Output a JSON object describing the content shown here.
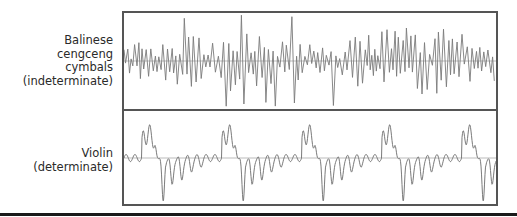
{
  "panels": [
    {
      "id": "cymbals",
      "label_lines": [
        "Balinese",
        "cengceng",
        "cymbals",
        "(indeterminate)"
      ],
      "waveform_type": "indeterminate",
      "description": "irregular noisy waveform with random amplitude spikes"
    },
    {
      "id": "violin",
      "label_lines": [
        "Violin",
        "(determinate)"
      ],
      "waveform_type": "determinate",
      "description": "periodic waveform repeating ~5 cycles",
      "cycles": 5
    }
  ],
  "colors": {
    "waveform": "#7a7a7a",
    "baseline": "#aaaaaa",
    "frame": "#555555",
    "label_text": "#2a2a2a",
    "rule": "#1a1a1a"
  }
}
